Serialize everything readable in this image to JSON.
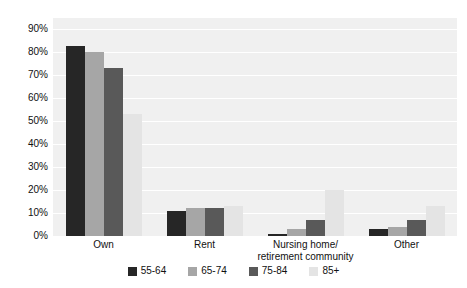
{
  "chart_data": {
    "type": "bar",
    "title": "",
    "subtitle": "",
    "xlabel": "",
    "ylabel": "",
    "categories": [
      "Own",
      "Rent",
      "Nursing home/\nretirement community",
      "Other"
    ],
    "category_lines": [
      [
        "Own"
      ],
      [
        "Rent"
      ],
      [
        "Nursing home/",
        "retirement community"
      ],
      [
        "Other"
      ]
    ],
    "series": [
      {
        "name": "55-64",
        "color": "#262626",
        "values": [
          83,
          11,
          1,
          3
        ]
      },
      {
        "name": "65-74",
        "color": "#a6a6a6",
        "values": [
          80,
          12,
          3,
          4
        ]
      },
      {
        "name": "75-84",
        "color": "#595959",
        "values": [
          73,
          12,
          7,
          7
        ]
      },
      {
        "name": "85+",
        "color": "#e4e4e4",
        "values": [
          53,
          13,
          20,
          13
        ]
      }
    ],
    "ylim": [
      0,
      95
    ],
    "yticks": [
      0,
      10,
      20,
      30,
      40,
      50,
      60,
      70,
      80,
      90
    ],
    "ytick_labels": [
      "0%",
      "10%",
      "20%",
      "30%",
      "40%",
      "50%",
      "60%",
      "70%",
      "80%",
      "90%"
    ],
    "grid": true,
    "legend_position": "bottom",
    "plot_background": "#f0f0f0",
    "gridline_color": "#ffffff"
  }
}
